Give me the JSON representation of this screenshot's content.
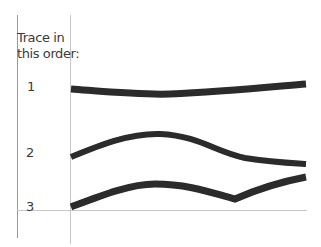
{
  "instruction": {
    "line1": "Trace in",
    "line2": "this order:"
  },
  "traces": [
    {
      "number": "1",
      "path": "M71,89 C110,92 140,95 170,94 C220,92 260,88 306,84"
    },
    {
      "number": "2",
      "path": "M71,157 C100,145 130,133 160,134 C200,136 215,152 245,158 C270,162 290,163 306,164"
    },
    {
      "number": "3",
      "path": "M71,207 C100,196 130,184 155,184 C190,184 215,194 235,199 C260,188 285,181 306,177"
    }
  ],
  "colors": {
    "stroke": "#2b2b2b",
    "guide": "#bdbdbd",
    "text": "#3a3a3a"
  }
}
